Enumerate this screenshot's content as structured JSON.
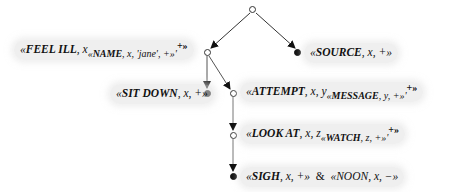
{
  "diagram": {
    "type": "tree",
    "nodes": [
      {
        "id": "root",
        "kind": "open",
        "label": null
      },
      {
        "id": "feel_ill",
        "kind": "open",
        "parts": {
          "head": "FEEL ILL",
          "arg": "x",
          "sub_head": "NAME",
          "sub_args": "x, 'jane', +",
          "tail": "+"
        }
      },
      {
        "id": "source",
        "kind": "filled",
        "parts": {
          "head": "SOURCE",
          "args": "x, +"
        }
      },
      {
        "id": "sit_down",
        "kind": "filled",
        "parts": {
          "head": "SIT DOWN",
          "args": "x, +"
        }
      },
      {
        "id": "attempt",
        "kind": "open",
        "parts": {
          "head": "ATTEMPT",
          "arg": "x, y",
          "sub_head": "MESSAGE",
          "sub_args": "y, +",
          "tail": "+"
        }
      },
      {
        "id": "look_at",
        "kind": "open",
        "parts": {
          "head": "LOOK AT",
          "arg": "x, z",
          "sub_head": "WATCH",
          "sub_args": "z, +",
          "tail": "+"
        }
      },
      {
        "id": "sigh",
        "kind": "filled",
        "parts": {
          "head": "SIGH",
          "args": "x, +",
          "conj": "&",
          "head2": "NOON",
          "args2": "x, −"
        }
      }
    ],
    "edges": [
      [
        "root",
        "feel_ill"
      ],
      [
        "root",
        "source"
      ],
      [
        "feel_ill",
        "sit_down"
      ],
      [
        "feel_ill",
        "attempt"
      ],
      [
        "attempt",
        "look_at"
      ],
      [
        "look_at",
        "sigh"
      ]
    ],
    "symbols": {
      "lq": "«",
      "rq": "»",
      "comma": ", ",
      "prime": "'"
    }
  }
}
